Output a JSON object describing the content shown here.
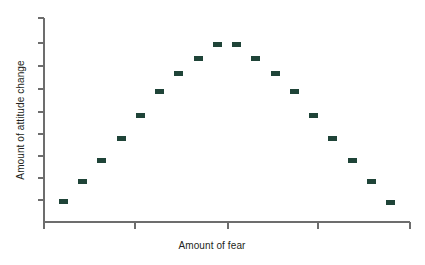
{
  "chart_data": {
    "type": "scatter",
    "title": "",
    "subtitle": "",
    "xlabel": "Amount of fear",
    "ylabel": "Amount of attitude change",
    "grid": false,
    "legend": false,
    "legend_position": "none",
    "marker_color": "#1f4438",
    "marker_shape": "rectangle",
    "marker_width_px": 9,
    "marker_height_px": 5,
    "axis_color": "#6d6d6d",
    "x_tick_labels": [],
    "y_tick_labels": [],
    "x_tick_count": 5,
    "y_tick_count": 9,
    "xlim": [
      0,
      19
    ],
    "ylim": [
      0,
      10
    ],
    "x": [
      1,
      2,
      3,
      4,
      5,
      6,
      7,
      8,
      9,
      10,
      11,
      12,
      13,
      14,
      15,
      16,
      17,
      18
    ],
    "y": [
      1.0,
      2.0,
      3.0,
      4.1,
      5.2,
      6.4,
      7.3,
      8.0,
      8.7,
      8.7,
      8.0,
      7.3,
      6.4,
      5.2,
      4.1,
      3.0,
      2.0,
      0.95
    ],
    "series": [
      {
        "name": "Attitude change",
        "color": "#1f4438",
        "values": [
          1.0,
          2.0,
          3.0,
          4.1,
          5.2,
          6.4,
          7.3,
          8.0,
          8.7,
          8.7,
          8.0,
          7.3,
          6.4,
          5.2,
          4.1,
          3.0,
          2.0,
          0.95
        ]
      }
    ],
    "points": [
      {
        "x": 1,
        "y": 1.0
      },
      {
        "x": 2,
        "y": 2.0
      },
      {
        "x": 3,
        "y": 3.0
      },
      {
        "x": 4,
        "y": 4.1
      },
      {
        "x": 5,
        "y": 5.2
      },
      {
        "x": 6,
        "y": 6.4
      },
      {
        "x": 7,
        "y": 7.3
      },
      {
        "x": 8,
        "y": 8.0
      },
      {
        "x": 9,
        "y": 8.7
      },
      {
        "x": 10,
        "y": 8.7
      },
      {
        "x": 11,
        "y": 8.0
      },
      {
        "x": 12,
        "y": 7.3
      },
      {
        "x": 13,
        "y": 6.4
      },
      {
        "x": 14,
        "y": 5.2
      },
      {
        "x": 15,
        "y": 4.1
      },
      {
        "x": 16,
        "y": 3.0
      },
      {
        "x": 17,
        "y": 2.0
      },
      {
        "x": 18,
        "y": 0.95
      }
    ]
  },
  "geometry": {
    "plot_left": 44,
    "plot_right": 410,
    "plot_top": 18,
    "plot_bottom": 222,
    "y_axis_x": 44,
    "x_axis_y": 222,
    "y_tick_positions": [
      18,
      43,
      66,
      89,
      112,
      134,
      156,
      178,
      200
    ],
    "x_tick_positions": [
      44,
      135,
      228,
      318,
      410
    ]
  }
}
